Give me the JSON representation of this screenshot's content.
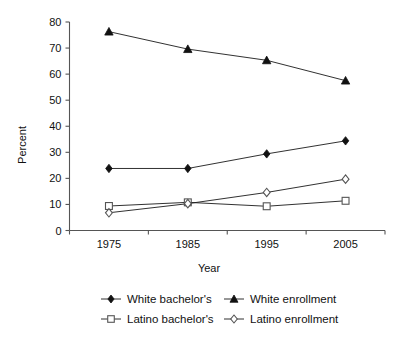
{
  "chart_data": {
    "type": "line",
    "title": "",
    "xlabel": "Year",
    "ylabel": "Percent",
    "categories": [
      "1975",
      "1985",
      "1995",
      "2005"
    ],
    "x": [
      1975,
      1985,
      1995,
      2005
    ],
    "ylim": [
      0,
      80
    ],
    "yticks": [
      0,
      10,
      20,
      30,
      40,
      50,
      60,
      70,
      80
    ],
    "ytick_labels": [
      "0",
      "10",
      "20",
      "30",
      "40",
      "50",
      "60",
      "70",
      "80"
    ],
    "grid": false,
    "legend_position": "bottom",
    "series": [
      {
        "name": "White bachelor's",
        "marker": "filled-diamond",
        "values": [
          23.8,
          23.8,
          29.4,
          34.4
        ]
      },
      {
        "name": "White enrollment",
        "marker": "filled-triangle",
        "values": [
          76.3,
          69.6,
          65.3,
          57.5
        ]
      },
      {
        "name": "Latino bachelor's",
        "marker": "open-square",
        "values": [
          9.4,
          10.8,
          9.3,
          11.4
        ]
      },
      {
        "name": "Latino enrollment",
        "marker": "open-diamond",
        "values": [
          6.8,
          10.3,
          14.6,
          19.7
        ]
      }
    ]
  },
  "axes": {
    "y_label": "Percent",
    "x_label": "Year"
  },
  "legend": {
    "entries": [
      {
        "label": "White bachelor's",
        "marker": "filled-diamond"
      },
      {
        "label": "White enrollment",
        "marker": "filled-triangle"
      },
      {
        "label": "Latino bachelor's",
        "marker": "open-square"
      },
      {
        "label": "Latino enrollment",
        "marker": "open-diamond"
      }
    ]
  }
}
